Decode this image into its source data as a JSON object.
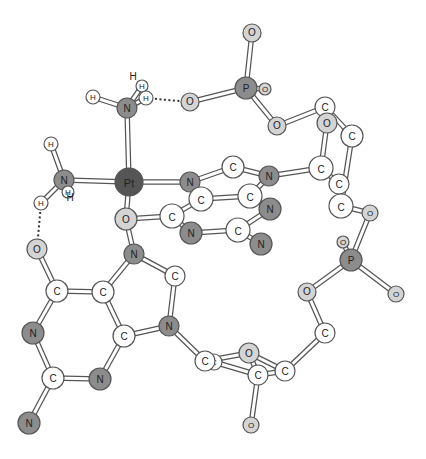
{
  "diagram": {
    "type": "ball-and-stick molecular structure",
    "colors": {
      "background": "#ffffff",
      "carbon": "#ffffff",
      "hydrogen": "#ffffff",
      "nitrogen": "#8c8c8c",
      "oxygen": "#d4d4d4",
      "phosphorus": "#8c8c8c",
      "platinum": "#555555",
      "stroke": "#555555",
      "bond_fill": "#ffffff"
    },
    "atoms": [
      {
        "id": "O1",
        "label": "O",
        "el": "O",
        "x": 252,
        "y": 33,
        "r": 9
      },
      {
        "id": "P1",
        "label": "P",
        "el": "P",
        "x": 246,
        "y": 88,
        "r": 11
      },
      {
        "id": "O2",
        "label": "O",
        "el": "O",
        "x": 265,
        "y": 89,
        "r": 6
      },
      {
        "id": "O3",
        "label": "O",
        "el": "O",
        "x": 190,
        "y": 102,
        "r": 9
      },
      {
        "id": "O4",
        "label": "O",
        "el": "O",
        "x": 277,
        "y": 126,
        "r": 9
      },
      {
        "id": "H1",
        "label": "H",
        "el": "H",
        "x": 142,
        "y": 86,
        "r": 6
      },
      {
        "id": "H2",
        "label": "H",
        "el": "H",
        "x": 146,
        "y": 98,
        "r": 7
      },
      {
        "id": "H3",
        "label": "H",
        "el": "H",
        "x": 93,
        "y": 97,
        "r": 7
      },
      {
        "id": "N1",
        "label": "N",
        "el": "N",
        "x": 127,
        "y": 108,
        "r": 10
      },
      {
        "id": "Pt",
        "label": "Pt",
        "el": "Pt",
        "x": 129,
        "y": 182,
        "r": 14
      },
      {
        "id": "N2",
        "label": "N",
        "el": "N",
        "x": 64,
        "y": 180,
        "r": 10
      },
      {
        "id": "H4",
        "label": "H",
        "el": "H",
        "x": 51,
        "y": 144,
        "r": 7
      },
      {
        "id": "H5",
        "label": "H",
        "el": "H",
        "x": 68,
        "y": 192,
        "r": 6
      },
      {
        "id": "H6",
        "label": "H",
        "el": "H",
        "x": 41,
        "y": 203,
        "r": 7
      },
      {
        "id": "O5",
        "label": "O",
        "el": "O",
        "x": 126,
        "y": 219,
        "r": 11
      },
      {
        "id": "N3",
        "label": "N",
        "el": "N",
        "x": 134,
        "y": 254,
        "r": 10
      },
      {
        "id": "C1",
        "label": "C",
        "el": "C",
        "x": 175,
        "y": 276,
        "r": 10
      },
      {
        "id": "N4",
        "label": "N",
        "el": "N",
        "x": 169,
        "y": 326,
        "r": 10
      },
      {
        "id": "C2",
        "label": "C",
        "el": "C",
        "x": 124,
        "y": 336,
        "r": 11
      },
      {
        "id": "C3",
        "label": "C",
        "el": "C",
        "x": 103,
        "y": 292,
        "r": 11
      },
      {
        "id": "C4",
        "label": "C",
        "el": "C",
        "x": 57,
        "y": 291,
        "r": 11
      },
      {
        "id": "O6",
        "label": "O",
        "el": "O",
        "x": 37,
        "y": 249,
        "r": 10
      },
      {
        "id": "N5",
        "label": "N",
        "el": "N",
        "x": 33,
        "y": 333,
        "r": 11
      },
      {
        "id": "C5",
        "label": "C",
        "el": "C",
        "x": 53,
        "y": 378,
        "r": 11
      },
      {
        "id": "N6",
        "label": "N",
        "el": "N",
        "x": 29,
        "y": 423,
        "r": 11
      },
      {
        "id": "N7",
        "label": "N",
        "el": "N",
        "x": 100,
        "y": 379,
        "r": 11
      },
      {
        "id": "N8",
        "label": "N",
        "el": "N",
        "x": 190,
        "y": 182,
        "r": 10
      },
      {
        "id": "C6",
        "label": "C",
        "el": "C",
        "x": 233,
        "y": 167,
        "r": 11
      },
      {
        "id": "N9",
        "label": "N",
        "el": "N",
        "x": 269,
        "y": 176,
        "r": 10
      },
      {
        "id": "C7",
        "label": "C",
        "el": "C",
        "x": 201,
        "y": 199,
        "r": 12
      },
      {
        "id": "C8",
        "label": "C",
        "el": "C",
        "x": 250,
        "y": 196,
        "r": 12
      },
      {
        "id": "N10",
        "label": "N",
        "el": "N",
        "x": 270,
        "y": 209,
        "r": 11
      },
      {
        "id": "C9",
        "label": "C",
        "el": "C",
        "x": 172,
        "y": 216,
        "r": 12
      },
      {
        "id": "N11",
        "label": "N",
        "el": "N",
        "x": 191,
        "y": 233,
        "r": 11
      },
      {
        "id": "C10",
        "label": "C",
        "el": "C",
        "x": 238,
        "y": 230,
        "r": 12
      },
      {
        "id": "N12",
        "label": "N",
        "el": "N",
        "x": 261,
        "y": 244,
        "r": 11
      },
      {
        "id": "C11",
        "label": "C",
        "el": "C",
        "x": 325,
        "y": 107,
        "r": 10
      },
      {
        "id": "O7",
        "label": "O",
        "el": "O",
        "x": 327,
        "y": 123,
        "r": 10
      },
      {
        "id": "C12",
        "label": "C",
        "el": "C",
        "x": 352,
        "y": 136,
        "r": 11
      },
      {
        "id": "C13",
        "label": "C",
        "el": "C",
        "x": 321,
        "y": 168,
        "r": 12
      },
      {
        "id": "C14",
        "label": "C",
        "el": "C",
        "x": 339,
        "y": 184,
        "r": 10
      },
      {
        "id": "C15",
        "label": "C",
        "el": "C",
        "x": 341,
        "y": 206,
        "r": 12
      },
      {
        "id": "O8",
        "label": "O",
        "el": "O",
        "x": 370,
        "y": 213,
        "r": 8
      },
      {
        "id": "P2",
        "label": "P",
        "el": "P",
        "x": 351,
        "y": 260,
        "r": 11
      },
      {
        "id": "O9",
        "label": "O",
        "el": "O",
        "x": 343,
        "y": 242,
        "r": 6
      },
      {
        "id": "O10",
        "label": "O",
        "el": "O",
        "x": 396,
        "y": 294,
        "r": 8
      },
      {
        "id": "O11",
        "label": "O",
        "el": "O",
        "x": 307,
        "y": 292,
        "r": 9
      },
      {
        "id": "C16",
        "label": "C",
        "el": "C",
        "x": 325,
        "y": 333,
        "r": 10
      },
      {
        "id": "C17",
        "label": "C",
        "el": "C",
        "x": 285,
        "y": 371,
        "r": 10
      },
      {
        "id": "O12",
        "label": "O",
        "el": "O",
        "x": 249,
        "y": 353,
        "r": 10
      },
      {
        "id": "C18",
        "label": "C",
        "el": "C",
        "x": 258,
        "y": 375,
        "r": 10
      },
      {
        "id": "C19",
        "label": "C",
        "el": "C",
        "x": 214,
        "y": 362,
        "r": 8
      },
      {
        "id": "C20",
        "label": "C",
        "el": "C",
        "x": 205,
        "y": 361,
        "r": 10
      },
      {
        "id": "O13",
        "label": "O",
        "el": "O",
        "x": 251,
        "y": 425,
        "r": 8
      }
    ],
    "bonds": [
      [
        "O1",
        "P1"
      ],
      [
        "P1",
        "O2"
      ],
      [
        "P1",
        "O3"
      ],
      [
        "P1",
        "O4"
      ],
      [
        "N1",
        "H3"
      ],
      [
        "N1",
        "H1"
      ],
      [
        "N1",
        "H2"
      ],
      [
        "N1",
        "Pt"
      ],
      [
        "Pt",
        "N2"
      ],
      [
        "N2",
        "H4"
      ],
      [
        "N2",
        "H6"
      ],
      [
        "N2",
        "H5"
      ],
      [
        "Pt",
        "N8"
      ],
      [
        "Pt",
        "O5"
      ],
      [
        "O5",
        "N3"
      ],
      [
        "O5",
        "C9"
      ],
      [
        "N3",
        "C1"
      ],
      [
        "C1",
        "N4"
      ],
      [
        "N4",
        "C2"
      ],
      [
        "C2",
        "C3"
      ],
      [
        "C3",
        "N3"
      ],
      [
        "C3",
        "C4"
      ],
      [
        "C4",
        "O6"
      ],
      [
        "C4",
        "N5"
      ],
      [
        "N5",
        "C5"
      ],
      [
        "C5",
        "N6"
      ],
      [
        "C5",
        "N7"
      ],
      [
        "N7",
        "C2"
      ],
      [
        "N4",
        "C20"
      ],
      [
        "N8",
        "C6"
      ],
      [
        "C6",
        "N9"
      ],
      [
        "N9",
        "C8"
      ],
      [
        "N8",
        "C7"
      ],
      [
        "C7",
        "C8"
      ],
      [
        "C7",
        "C9"
      ],
      [
        "C8",
        "N10"
      ],
      [
        "C9",
        "N11"
      ],
      [
        "N11",
        "C10"
      ],
      [
        "C10",
        "N10"
      ],
      [
        "C10",
        "N12"
      ],
      [
        "N9",
        "C13"
      ],
      [
        "O4",
        "C11"
      ],
      [
        "C11",
        "C12"
      ],
      [
        "C11",
        "O7"
      ],
      [
        "O7",
        "C13"
      ],
      [
        "C12",
        "C15"
      ],
      [
        "C13",
        "C14"
      ],
      [
        "C14",
        "C15"
      ],
      [
        "C15",
        "O8"
      ],
      [
        "O8",
        "P2"
      ],
      [
        "P2",
        "O9"
      ],
      [
        "P2",
        "O10"
      ],
      [
        "P2",
        "O11"
      ],
      [
        "O11",
        "C16"
      ],
      [
        "C16",
        "C17"
      ],
      [
        "C17",
        "C18"
      ],
      [
        "C17",
        "O12"
      ],
      [
        "O12",
        "C20"
      ],
      [
        "C20",
        "C19"
      ],
      [
        "C19",
        "C18"
      ],
      [
        "C18",
        "O13"
      ],
      [
        "C18",
        "O12"
      ]
    ],
    "hbonds": [
      [
        "H2",
        "O3"
      ],
      [
        "H6",
        "O6"
      ]
    ],
    "h_labels": [
      {
        "label": "H",
        "x": 133,
        "y": 80
      },
      {
        "label": "H",
        "x": 70,
        "y": 201
      }
    ]
  }
}
